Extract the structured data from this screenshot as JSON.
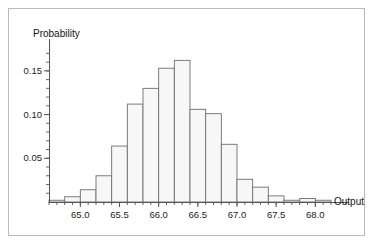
{
  "figure": {
    "background": "#ffffff",
    "frame_color": "#b9b9b9",
    "axis_color": "#555555",
    "bar_fill": "#f7f7f7",
    "bar_stroke": "#6e6e6e"
  },
  "chart_data": {
    "type": "bar",
    "title": "",
    "subtitle": "",
    "xlabel": "Output",
    "ylabel": "Probability",
    "xlim": [
      64.6,
      68.2
    ],
    "ylim": [
      0.0,
      0.175
    ],
    "grid": false,
    "legend": null,
    "bin_width": 0.2,
    "x_ticks": [
      65.0,
      65.5,
      66.0,
      66.5,
      67.0,
      67.5,
      68.0
    ],
    "x_tick_labels": [
      "65.0",
      "65.5",
      "66.0",
      "66.5",
      "67.0",
      "67.5",
      "68.0"
    ],
    "x_minor_tick_step": 0.1,
    "y_ticks": [
      0.05,
      0.1,
      0.15
    ],
    "y_tick_labels": [
      "0.05",
      "0.10",
      "0.15"
    ],
    "y_minor_tick_step": 0.01,
    "categories": [
      "64.6-64.8",
      "64.8-65.0",
      "65.0-65.2",
      "65.2-65.4",
      "65.4-65.6",
      "65.6-65.8",
      "65.8-66.0",
      "66.0-66.2",
      "66.2-66.4",
      "66.4-66.6",
      "66.6-66.8",
      "66.8-67.0",
      "67.0-67.2",
      "67.2-67.4",
      "67.4-67.6",
      "67.6-67.8",
      "67.8-68.0",
      "68.0-68.2"
    ],
    "bins": [
      {
        "x0": 64.6,
        "x1": 64.8,
        "value": 0.002
      },
      {
        "x0": 64.8,
        "x1": 65.0,
        "value": 0.006
      },
      {
        "x0": 65.0,
        "x1": 65.2,
        "value": 0.014
      },
      {
        "x0": 65.2,
        "x1": 65.4,
        "value": 0.03
      },
      {
        "x0": 65.4,
        "x1": 65.6,
        "value": 0.064
      },
      {
        "x0": 65.6,
        "x1": 65.8,
        "value": 0.112
      },
      {
        "x0": 65.8,
        "x1": 66.0,
        "value": 0.13
      },
      {
        "x0": 66.0,
        "x1": 66.2,
        "value": 0.153
      },
      {
        "x0": 66.2,
        "x1": 66.4,
        "value": 0.162
      },
      {
        "x0": 66.4,
        "x1": 66.6,
        "value": 0.106
      },
      {
        "x0": 66.6,
        "x1": 66.8,
        "value": 0.101
      },
      {
        "x0": 66.8,
        "x1": 67.0,
        "value": 0.066
      },
      {
        "x0": 67.0,
        "x1": 67.2,
        "value": 0.026
      },
      {
        "x0": 67.2,
        "x1": 67.4,
        "value": 0.017
      },
      {
        "x0": 67.4,
        "x1": 67.6,
        "value": 0.007
      },
      {
        "x0": 67.6,
        "x1": 67.8,
        "value": 0.002
      },
      {
        "x0": 67.8,
        "x1": 68.0,
        "value": 0.004
      },
      {
        "x0": 68.0,
        "x1": 68.2,
        "value": 0.002
      }
    ],
    "values": [
      0.002,
      0.006,
      0.014,
      0.03,
      0.064,
      0.112,
      0.13,
      0.153,
      0.162,
      0.106,
      0.101,
      0.066,
      0.026,
      0.017,
      0.007,
      0.002,
      0.004,
      0.002
    ]
  }
}
